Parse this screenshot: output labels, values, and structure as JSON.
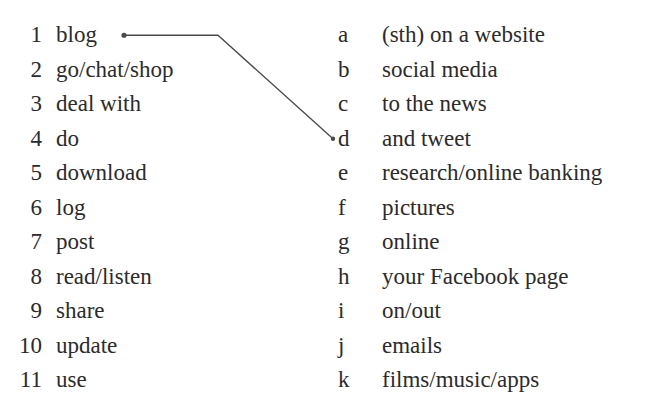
{
  "worksheet": {
    "top_clipped_text": "",
    "left_column": {
      "items": [
        {
          "marker": "1",
          "term": "blog"
        },
        {
          "marker": "2",
          "term": "go/chat/shop"
        },
        {
          "marker": "3",
          "term": "deal with"
        },
        {
          "marker": "4",
          "term": "do"
        },
        {
          "marker": "5",
          "term": "download"
        },
        {
          "marker": "6",
          "term": "log"
        },
        {
          "marker": "7",
          "term": "post"
        },
        {
          "marker": "8",
          "term": "read/listen"
        },
        {
          "marker": "9",
          "term": "share"
        },
        {
          "marker": "10",
          "term": "update"
        },
        {
          "marker": "11",
          "term": "use"
        }
      ]
    },
    "right_column": {
      "items": [
        {
          "marker": "a",
          "term": "(sth) on a website"
        },
        {
          "marker": "b",
          "term": "social media"
        },
        {
          "marker": "c",
          "term": "to the news"
        },
        {
          "marker": "d",
          "term": "and tweet"
        },
        {
          "marker": "e",
          "term": "research/online banking"
        },
        {
          "marker": "f",
          "term": "pictures"
        },
        {
          "marker": "g",
          "term": "online"
        },
        {
          "marker": "h",
          "term": "your Facebook page"
        },
        {
          "marker": "i",
          "term": "on/out"
        },
        {
          "marker": "j",
          "term": "emails"
        },
        {
          "marker": "k",
          "term": "films/music/apps"
        }
      ]
    },
    "connections": [
      {
        "from": "1",
        "to": "d"
      }
    ],
    "colors": {
      "text": "#2b2b2b",
      "background": "#ffffff",
      "connector_line": "#4a4a4a"
    }
  }
}
